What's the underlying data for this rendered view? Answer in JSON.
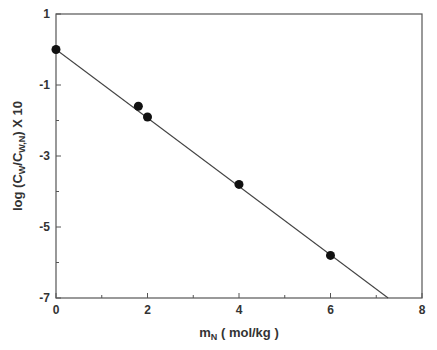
{
  "chart_data": {
    "type": "scatter",
    "title": "",
    "xlabel": "m_N ( mol/kg )",
    "ylabel": "log (C_W/C_W,N) X 10",
    "xlim": [
      0,
      8
    ],
    "ylim": [
      -7,
      1
    ],
    "x_ticks": [
      0,
      2,
      4,
      6,
      8
    ],
    "y_ticks": [
      1,
      -1,
      -3,
      -5,
      -7
    ],
    "grid": false,
    "legend": null,
    "series": [
      {
        "name": "data",
        "x": [
          0,
          1.8,
          2.0,
          4.0,
          6.0
        ],
        "y": [
          0.0,
          -1.6,
          -1.9,
          -3.8,
          -5.8
        ]
      }
    ],
    "fit_line": {
      "x": [
        0,
        7.26
      ],
      "y": [
        0.0,
        -7.0
      ],
      "slope": -0.964,
      "intercept": 0.0
    }
  },
  "axes": {
    "x_label_main": "m",
    "x_label_sub": "N",
    "x_label_rest": " ( mol/kg )",
    "y_label_pre": "log (C",
    "y_label_sub1": "W",
    "y_label_mid": "/C",
    "y_label_sub2": "W,N",
    "y_label_post": ") X 10"
  }
}
